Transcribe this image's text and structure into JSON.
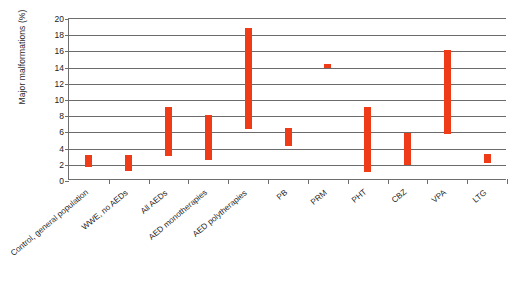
{
  "chart_data": {
    "type": "bar",
    "subtype": "floating-range-bar",
    "title": "",
    "xlabel": "",
    "ylabel": "Major malformations (%)",
    "ylim": [
      0,
      20
    ],
    "ytick_step": 2,
    "yticks": [
      0,
      2,
      4,
      6,
      8,
      10,
      12,
      14,
      16,
      18,
      20
    ],
    "grid": true,
    "legend": "none",
    "bar_color": "#f03b18",
    "axis_color": "#6e6e6e",
    "categories": [
      "Control, general population",
      "WWE, no AEDs",
      "All AEDs",
      "AED monotherapies",
      "AED polytherapies",
      "PB",
      "PRM",
      "PHT",
      "CBZ",
      "VPA",
      "LTG"
    ],
    "ranges": [
      {
        "category": "Control, general population",
        "low": 1.7,
        "high": 3.2
      },
      {
        "category": "WWE, no AEDs",
        "low": 1.2,
        "high": 3.2
      },
      {
        "category": "All AEDs",
        "low": 3.1,
        "high": 9.1
      },
      {
        "category": "AED monotherapies",
        "low": 2.6,
        "high": 8.1
      },
      {
        "category": "AED polytherapies",
        "low": 6.4,
        "high": 18.9
      },
      {
        "category": "PB",
        "low": 4.3,
        "high": 6.5
      },
      {
        "category": "PRM",
        "low": 14.1,
        "high": 14.4
      },
      {
        "category": "PHT",
        "low": 1.1,
        "high": 9.1
      },
      {
        "category": "CBZ",
        "low": 2.0,
        "high": 5.9
      },
      {
        "category": "VPA",
        "low": 5.8,
        "high": 16.2
      },
      {
        "category": "LTG",
        "low": 2.2,
        "high": 3.3
      }
    ]
  }
}
